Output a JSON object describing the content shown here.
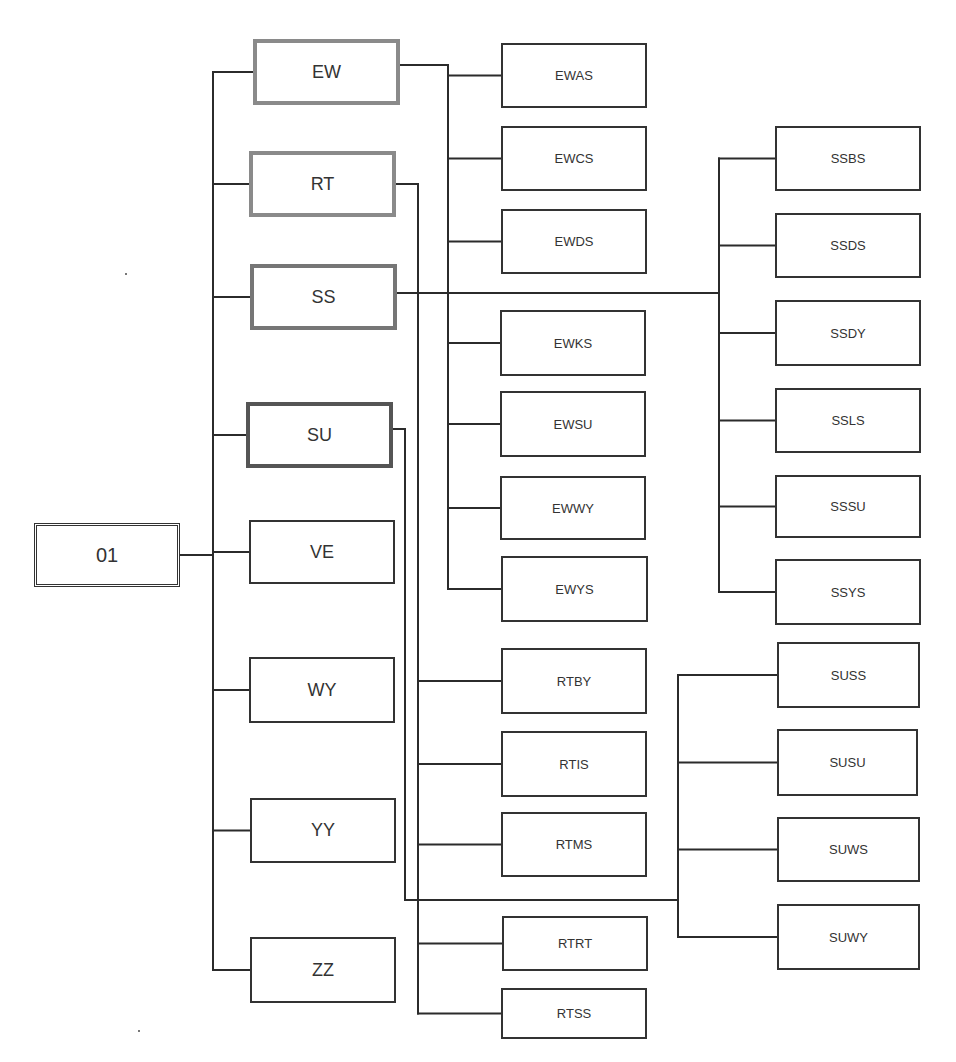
{
  "diagram": {
    "type": "tree",
    "root": {
      "id": "01",
      "label": "01",
      "x": 34,
      "y": 523,
      "w": 146,
      "h": 64
    },
    "level1": [
      {
        "id": "EW",
        "label": "EW",
        "x": 253,
        "y": 39,
        "w": 147,
        "h": 66,
        "style": "hl-light"
      },
      {
        "id": "RT",
        "label": "RT",
        "x": 249,
        "y": 151,
        "w": 147,
        "h": 66,
        "style": "hl-light"
      },
      {
        "id": "SS",
        "label": "SS",
        "x": 250,
        "y": 264,
        "w": 147,
        "h": 66,
        "style": "hl-mid"
      },
      {
        "id": "SU",
        "label": "SU",
        "x": 246,
        "y": 402,
        "w": 147,
        "h": 66,
        "style": "hl-dark"
      },
      {
        "id": "VE",
        "label": "VE",
        "x": 249,
        "y": 520,
        "w": 146,
        "h": 64,
        "style": ""
      },
      {
        "id": "WY",
        "label": "WY",
        "x": 249,
        "y": 657,
        "w": 146,
        "h": 66,
        "style": ""
      },
      {
        "id": "YY",
        "label": "YY",
        "x": 250,
        "y": 798,
        "w": 146,
        "h": 65,
        "style": ""
      },
      {
        "id": "ZZ",
        "label": "ZZ",
        "x": 250,
        "y": 937,
        "w": 146,
        "h": 66,
        "style": ""
      }
    ],
    "level2": [
      {
        "id": "EWAS",
        "label": "EWAS",
        "parent": "EW",
        "x": 501,
        "y": 43,
        "w": 146,
        "h": 65
      },
      {
        "id": "EWCS",
        "label": "EWCS",
        "parent": "EW",
        "x": 501,
        "y": 126,
        "w": 146,
        "h": 65
      },
      {
        "id": "EWDS",
        "label": "EWDS",
        "parent": "EW",
        "x": 501,
        "y": 209,
        "w": 146,
        "h": 65
      },
      {
        "id": "EWKS",
        "label": "EWKS",
        "parent": "EW",
        "x": 500,
        "y": 310,
        "w": 146,
        "h": 66
      },
      {
        "id": "EWSU",
        "label": "EWSU",
        "parent": "EW",
        "x": 500,
        "y": 391,
        "w": 146,
        "h": 66
      },
      {
        "id": "EWWY",
        "label": "EWWY",
        "parent": "EW",
        "x": 500,
        "y": 476,
        "w": 146,
        "h": 64
      },
      {
        "id": "EWYS",
        "label": "EWYS",
        "parent": "EW",
        "x": 501,
        "y": 556,
        "w": 147,
        "h": 66
      },
      {
        "id": "RTBY",
        "label": "RTBY",
        "parent": "RT",
        "x": 501,
        "y": 648,
        "w": 146,
        "h": 66
      },
      {
        "id": "RTIS",
        "label": "RTIS",
        "parent": "RT",
        "x": 501,
        "y": 731,
        "w": 146,
        "h": 66
      },
      {
        "id": "RTMS",
        "label": "RTMS",
        "parent": "RT",
        "x": 501,
        "y": 812,
        "w": 146,
        "h": 65
      },
      {
        "id": "RTRT",
        "label": "RTRT",
        "parent": "RT",
        "x": 502,
        "y": 916,
        "w": 146,
        "h": 55
      },
      {
        "id": "RTSS",
        "label": "RTSS",
        "parent": "RT",
        "x": 501,
        "y": 988,
        "w": 146,
        "h": 51
      },
      {
        "id": "SSBS",
        "label": "SSBS",
        "parent": "SS",
        "x": 775,
        "y": 126,
        "w": 146,
        "h": 65
      },
      {
        "id": "SSDS",
        "label": "SSDS",
        "parent": "SS",
        "x": 775,
        "y": 213,
        "w": 146,
        "h": 65
      },
      {
        "id": "SSDY",
        "label": "SSDY",
        "parent": "SS",
        "x": 775,
        "y": 300,
        "w": 146,
        "h": 66
      },
      {
        "id": "SSLS",
        "label": "SSLS",
        "parent": "SS",
        "x": 775,
        "y": 388,
        "w": 146,
        "h": 65
      },
      {
        "id": "SSSU",
        "label": "SSSU",
        "parent": "SS",
        "x": 775,
        "y": 475,
        "w": 146,
        "h": 63
      },
      {
        "id": "SSYS",
        "label": "SSYS",
        "parent": "SS",
        "x": 775,
        "y": 559,
        "w": 146,
        "h": 66
      },
      {
        "id": "SUSS",
        "label": "SUSS",
        "parent": "SU",
        "x": 777,
        "y": 642,
        "w": 143,
        "h": 66
      },
      {
        "id": "SUSU",
        "label": "SUSU",
        "parent": "SU",
        "x": 777,
        "y": 729,
        "w": 141,
        "h": 67
      },
      {
        "id": "SUWS",
        "label": "SUWS",
        "parent": "SU",
        "x": 777,
        "y": 817,
        "w": 143,
        "h": 65
      },
      {
        "id": "SUWY",
        "label": "SUWY",
        "parent": "SU",
        "x": 777,
        "y": 904,
        "w": 143,
        "h": 66
      }
    ],
    "connectors": {
      "root_bus_x": 213,
      "ew_bus_x": 448,
      "rt_bus_x": 418,
      "ss_bus_x": 719,
      "su_bus_x": 678,
      "su_route_x": 405,
      "su_route_y": 900
    },
    "colors": {
      "line": "#2b2b2b",
      "text": "#333333",
      "highlight_light": "#8a8a8a",
      "highlight_mid": "#767676",
      "highlight_dark": "#555555"
    }
  }
}
